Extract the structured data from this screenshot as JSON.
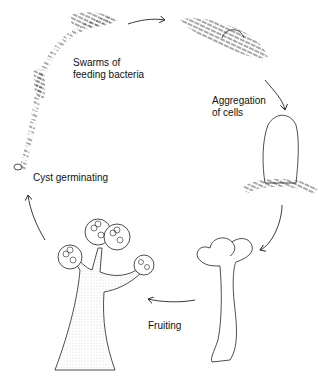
{
  "diagram": {
    "type": "life-cycle",
    "stages": [
      {
        "id": "swarms",
        "label_line1": "Swarms of",
        "label_line2": "feeding bacteria"
      },
      {
        "id": "aggregation",
        "label_line1": "Aggregation",
        "label_line2": "of cells"
      },
      {
        "id": "fruiting",
        "label": "Fruiting"
      },
      {
        "id": "cyst",
        "label": "Cyst germinating"
      }
    ],
    "colors": {
      "ink": "#222222",
      "background": "#ffffff"
    }
  }
}
